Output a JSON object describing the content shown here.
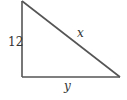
{
  "diagram": {
    "type": "right-triangle",
    "stroke_color": "#555555",
    "background": "#ffffff",
    "vertices": {
      "top": [
        22,
        1
      ],
      "bottom_left": [
        22,
        77
      ],
      "bottom_right": [
        120,
        77
      ]
    },
    "labels": {
      "vertical_leg": "12",
      "hypotenuse": "x",
      "horizontal_leg": "y"
    }
  }
}
